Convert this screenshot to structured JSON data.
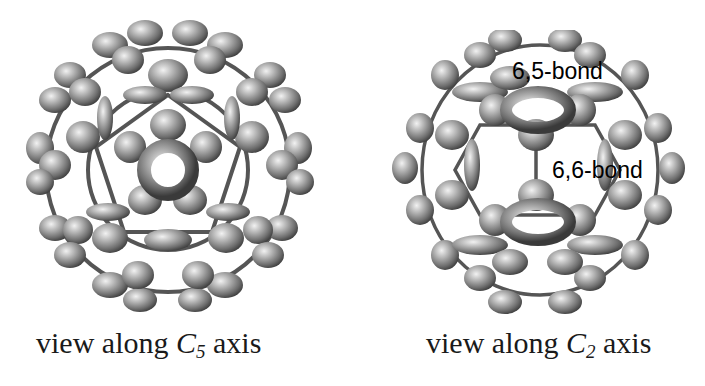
{
  "panels": [
    {
      "id": "c5",
      "caption": {
        "prefix": "view along ",
        "symbol": "C",
        "subscript": "5",
        "suffix": " axis"
      },
      "labels": []
    },
    {
      "id": "c2",
      "caption": {
        "prefix": "view along ",
        "symbol": "C",
        "subscript": "2",
        "suffix": " axis"
      },
      "labels": [
        {
          "text": "6,5-bond"
        },
        {
          "text": "6,6-bond"
        }
      ]
    }
  ],
  "colors": {
    "lobe": "#8a8a8a",
    "lobe_highlight": "#e6e6e6",
    "lobe_shadow": "#3a3a3a",
    "bond": "#4a4a4a",
    "background": "#ffffff"
  }
}
